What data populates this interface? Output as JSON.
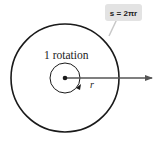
{
  "diagram": {
    "rotation_label": "1 rotation",
    "radius_label": "r",
    "formula_label": "s = 2πr",
    "colors": {
      "stroke": "#1a1a1a",
      "arrow": "#555555",
      "callout_bg": "#e3e3e3",
      "callout_line": "#c8c8c8"
    }
  }
}
